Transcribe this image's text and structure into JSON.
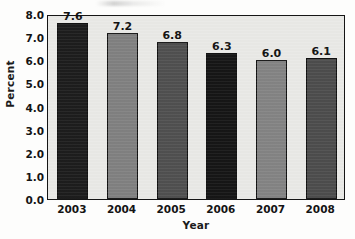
{
  "chart_data": {
    "type": "bar",
    "title": "",
    "subtitle": "",
    "xlabel": "Year",
    "ylabel": "Percent",
    "categories": [
      "2003",
      "2004",
      "2005",
      "2006",
      "2007",
      "2008"
    ],
    "values": [
      7.6,
      7.2,
      6.8,
      6.3,
      6.0,
      6.1
    ],
    "data_labels": [
      "7.6",
      "7.2",
      "6.8",
      "6.3",
      "6.0",
      "6.1"
    ],
    "ylim": [
      0.0,
      8.0
    ],
    "ytick_labels": [
      "8.0",
      "7.0",
      "6.0",
      "5.0",
      "4.0",
      "3.0",
      "2.0",
      "1.0",
      "0.0"
    ],
    "ytick_values": [
      8.0,
      7.0,
      6.0,
      5.0,
      4.0,
      3.0,
      2.0,
      1.0,
      0.0
    ],
    "grid": false,
    "legend": null,
    "legend_position": "none",
    "bar_colors": [
      "#1b1b1b",
      "#7f7f7f",
      "#4e4e4e",
      "#141414",
      "#828282",
      "#4b4b4b"
    ],
    "bar_border_color": "#0f0f0f",
    "plot_background": "#e9e9e6",
    "figure_background": "#fdfdfc",
    "axis_color": "#151515",
    "annotations": []
  }
}
